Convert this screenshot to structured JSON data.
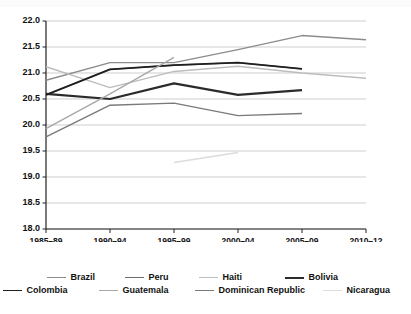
{
  "chart_data": {
    "type": "line",
    "title": "",
    "xlabel": "Years",
    "ylabel": "",
    "categories": [
      "1985–89",
      "1990–94",
      "1995–99",
      "2000–04",
      "2005–09",
      "2010–12"
    ],
    "ylim": [
      18.0,
      22.0
    ],
    "ytick_step": 0.5,
    "yticks": [
      "22.0",
      "21.5",
      "21.0",
      "20.5",
      "20.0",
      "19.5",
      "19.0",
      "18.5",
      "18.0"
    ],
    "grid": true,
    "grid_axis": "y",
    "legend_position": "bottom",
    "series": [
      {
        "name": "Brazil",
        "color": "#8c8c8c",
        "width": 1.4,
        "values": [
          20.86,
          21.2,
          21.2,
          21.45,
          21.72,
          21.64
        ]
      },
      {
        "name": "Peru",
        "color": "#6e6e6e",
        "width": 1.4,
        "values": [
          20.58,
          21.07,
          21.15,
          21.2,
          21.08,
          null
        ]
      },
      {
        "name": "Haiti",
        "color": "#bdbdbd",
        "width": 1.4,
        "values": [
          21.12,
          20.72,
          21.03,
          21.13,
          21.0,
          20.9
        ]
      },
      {
        "name": "Bolivia",
        "color": "#2b2b2b",
        "width": 2.2,
        "values": [
          20.6,
          20.5,
          20.8,
          20.58,
          20.67,
          null
        ]
      },
      {
        "name": "Colombia",
        "color": "#1f1f1f",
        "width": 1.7,
        "values": [
          20.58,
          21.07,
          21.15,
          21.2,
          21.08,
          null
        ]
      },
      {
        "name": "Guatemala",
        "color": "#a8a8a8",
        "width": 1.4,
        "values": [
          19.93,
          20.6,
          21.3,
          null,
          null,
          null
        ]
      },
      {
        "name": "Dominican Republic",
        "color": "#7a7a7a",
        "width": 1.4,
        "values": [
          19.77,
          20.38,
          20.42,
          20.18,
          20.22,
          null
        ]
      },
      {
        "name": "Nicaragua",
        "color": "#dcdcdc",
        "width": 1.6,
        "values": [
          null,
          null,
          19.28,
          19.47,
          null,
          null
        ]
      }
    ]
  }
}
